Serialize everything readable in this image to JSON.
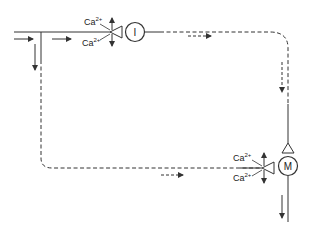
{
  "diagram": {
    "type": "flow-loop",
    "nodes": {
      "top_node": {
        "label": "I",
        "shape": "circle"
      },
      "bottom_node": {
        "label": "M",
        "shape": "circle"
      }
    },
    "labels": {
      "top_upper": {
        "base": "Ca",
        "sup": "2+"
      },
      "top_lower": {
        "base": "Ca",
        "sup": "2+"
      },
      "bottom_upper": {
        "base": "Ca",
        "sup": "2+"
      },
      "bottom_lower": {
        "base": "Ca",
        "sup": "2+"
      }
    },
    "colors": {
      "stroke": "#333333",
      "background": "#ffffff"
    }
  }
}
